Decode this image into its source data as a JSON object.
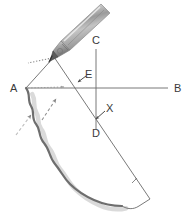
{
  "figure": {
    "background_color": "#ffffff",
    "width": 189,
    "height": 218,
    "line_color": "#555555",
    "label_color": "#3a3a3a",
    "pen_body_color": "#b8b8b8",
    "pen_highlight_color": "#e8e8e8",
    "pen_tip_color": "#4a4a4a",
    "wavy_edge_color": "#6e6e6e",
    "shadow_color": "#c9c9c9",
    "dotted_color": "#8a8a8a",
    "dashed_arrow_color": "#9a9a9a"
  },
  "labels": {
    "a": "A",
    "b": "B",
    "c": "C",
    "d": "D",
    "e": "E",
    "x": "X"
  },
  "icons": {
    "stylus": "stylus-pen-icon",
    "arrow_to_e": "arrow-pointer-icon",
    "arrow_to_x": "arrow-pointer-icon",
    "dashed_arrow_upper": "dashed-arrow-icon",
    "dashed_arrow_lower": "dashed-arrow-icon",
    "dotted_guide_a": "dotted-guide-icon",
    "dotted_guide_pen": "dotted-guide-icon",
    "tick_mark_lower_right": "tick-mark-icon"
  },
  "geometry": {
    "point_a": {
      "x": 26,
      "y": 88
    },
    "point_b": {
      "x": 172,
      "y": 88
    },
    "point_c": {
      "x": 96,
      "y": 48
    },
    "point_d": {
      "x": 96,
      "y": 126
    },
    "point_e": {
      "x": 81,
      "y": 79
    },
    "point_x": {
      "x": 99,
      "y": 117
    },
    "pen_tip": {
      "x": 54,
      "y": 57
    }
  }
}
